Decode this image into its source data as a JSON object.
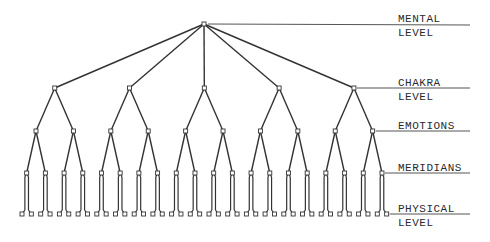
{
  "diagram": {
    "title": "",
    "levels": [
      {
        "id": "mental",
        "line1": "MENTAL",
        "line2": "LEVEL",
        "y": 24,
        "nodes": 1
      },
      {
        "id": "chakra",
        "line1": "CHAKRA",
        "line2": "LEVEL",
        "y": 88,
        "nodes": 5
      },
      {
        "id": "emotions",
        "line1": "EMOTIONS",
        "line2": "",
        "y": 131,
        "nodes": 10
      },
      {
        "id": "meridians",
        "line1": "MERIDIANS",
        "line2": "",
        "y": 173,
        "nodes": 20
      },
      {
        "id": "physical",
        "line1": "PHYSICAL",
        "line2": "LEVEL",
        "y": 214,
        "nodes": 40
      }
    ],
    "branching": [
      5,
      2,
      2,
      2
    ],
    "colors": {
      "line": "#333333",
      "node_fill": "#ffffff",
      "label_rule": "#555555",
      "text": "#2a2a2a"
    }
  }
}
